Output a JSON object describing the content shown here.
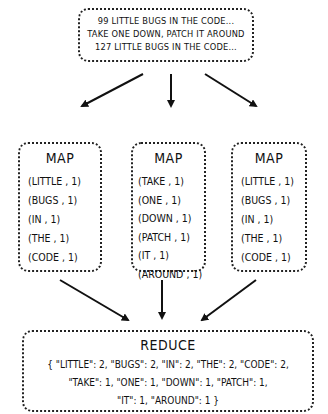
{
  "input": {
    "lines": [
      "99 LITTLE BUGS IN THE CODE...",
      "TAKE ONE DOWN, PATCH IT AROUND",
      "127 LITTLE BUGS IN THE CODE..."
    ]
  },
  "maps": [
    {
      "title": "MAP",
      "pairs": [
        "(LITTLE , 1)",
        "(BUGS , 1)",
        "(IN , 1)",
        "(THE , 1)",
        "(CODE , 1)"
      ]
    },
    {
      "title": "MAP",
      "pairs": [
        "(TAKE , 1)",
        "(ONE , 1)",
        "(DOWN , 1)",
        "(PATCH , 1)",
        "(IT , 1)",
        "(AROUND , 1)"
      ]
    },
    {
      "title": "MAP",
      "pairs": [
        "(LITTLE , 1)",
        "(BUGS , 1)",
        "(IN , 1)",
        "(THE , 1)",
        "(CODE , 1)"
      ]
    }
  ],
  "reduce": {
    "title": "REDUCE",
    "lines": [
      "{ \"LITTLE\": 2, \"BUGS\": 2, \"IN\": 2, \"THE\": 2, \"CODE\": 2,",
      "\"TAKE\": 1, \"ONE\": 1, \"DOWN\": 1, \"PATCH\": 1,",
      "\"IT\": 1, \"AROUND\": 1 }"
    ]
  }
}
